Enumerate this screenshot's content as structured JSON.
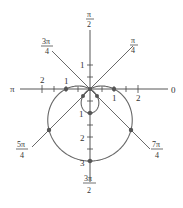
{
  "chart_data": {
    "type": "line",
    "subtype": "polar",
    "equation": "r = 1 - 2 sin θ",
    "title": "",
    "angle_labels": [
      "0",
      "π/4",
      "π/2",
      "3π/4",
      "π",
      "5π/4",
      "3π/2",
      "7π/4"
    ],
    "radial_ticks_labeled": {
      "right": [
        "1",
        "2"
      ],
      "left": [
        "1",
        "2"
      ],
      "up": [
        "1"
      ],
      "down": [
        "1",
        "2",
        "3"
      ]
    },
    "points": [
      {
        "theta": "0",
        "r": 1
      },
      {
        "theta": "π/4",
        "r": -0.41
      },
      {
        "theta": "π/2",
        "r": -1
      },
      {
        "theta": "3π/4",
        "r": -0.41
      },
      {
        "theta": "π",
        "r": 1
      },
      {
        "theta": "5π/4",
        "r": 2.41
      },
      {
        "theta": "3π/2",
        "r": 3
      },
      {
        "theta": "7π/4",
        "r": 2.41
      }
    ],
    "grid": false,
    "legend": "none"
  },
  "labels": {
    "zero": "0",
    "pi": "π",
    "pi2_num": "π",
    "pi2_den": "2",
    "pi4_num": "π",
    "pi4_den": "4",
    "p3pi4_num": "3π",
    "p3pi4_den": "4",
    "p5pi4_num": "5π",
    "p5pi4_den": "4",
    "p3pi2_num": "3π",
    "p3pi2_den": "2",
    "p7pi4_num": "7π",
    "p7pi4_den": "4",
    "r_right_1": "1",
    "r_right_2": "2",
    "r_left_1": "1",
    "r_left_2": "2",
    "r_up_1": "1",
    "r_down_1": "1",
    "r_down_2": "2",
    "r_down_3": "3"
  }
}
